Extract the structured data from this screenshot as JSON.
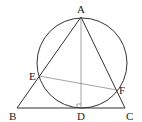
{
  "diagram": {
    "type": "geometry",
    "points": {
      "A": {
        "label": "A",
        "x": 81,
        "y": 17
      },
      "B": {
        "label": "B",
        "x": 17,
        "y": 108
      },
      "C": {
        "label": "C",
        "x": 125,
        "y": 108
      },
      "D": {
        "label": "D",
        "x": 81,
        "y": 108
      },
      "E": {
        "label": "E",
        "x": 39,
        "y": 76
      },
      "F": {
        "label": "F",
        "x": 117,
        "y": 90
      }
    },
    "circle": {
      "cx": 82,
      "cy": 63,
      "r": 45
    },
    "segments": [
      "AB",
      "AC",
      "BC",
      "AD",
      "EF"
    ],
    "right_angle_at": "D"
  }
}
